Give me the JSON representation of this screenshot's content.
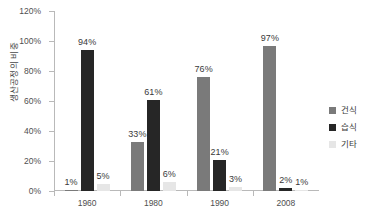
{
  "chart_data": {
    "type": "bar",
    "title": "",
    "subtitle": "",
    "xlabel": "",
    "ylabel": "생산공정의 비중",
    "categories": [
      "1960",
      "1980",
      "1990",
      "2008"
    ],
    "series": [
      {
        "name": "건식",
        "color": "#7a7a7a",
        "values": [
          1,
          33,
          76,
          97
        ],
        "labels": [
          "1%",
          "33%",
          "76%",
          "97%"
        ]
      },
      {
        "name": "습식",
        "color": "#262626",
        "values": [
          94,
          61,
          21,
          2
        ],
        "labels": [
          "94%",
          "61%",
          "21%",
          "2%"
        ]
      },
      {
        "name": "기타",
        "color": "#e6e6e6",
        "values": [
          5,
          6,
          3,
          1
        ],
        "labels": [
          "5%",
          "6%",
          "3%",
          "1%"
        ]
      }
    ],
    "ylim": [
      0,
      120
    ],
    "ytick_values": [
      0,
      20,
      40,
      60,
      80,
      100,
      120
    ],
    "ytick_labels": [
      "0%",
      "20%",
      "40%",
      "60%",
      "80%",
      "100%",
      "120%"
    ],
    "grid": false,
    "legend_position": "right",
    "axis_color": "#b9b9b9",
    "background": "#ffffff"
  }
}
